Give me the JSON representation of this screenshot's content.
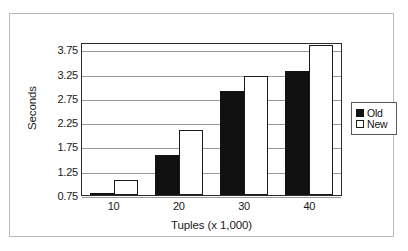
{
  "chart_data": {
    "type": "bar",
    "title": "",
    "xlabel": "Tuples (x 1,000)",
    "ylabel": "Seconds",
    "categories": [
      "10",
      "20",
      "30",
      "40"
    ],
    "yticks": [
      "3.75",
      "3.25",
      "2.75",
      "2.25",
      "1.75",
      "1.25",
      "0.75"
    ],
    "ylim": [
      0.75,
      3.9
    ],
    "grid": true,
    "legend_position": "right",
    "series": [
      {
        "name": "Old",
        "color": "#111111",
        "values": [
          0.8,
          1.57,
          2.9,
          3.31
        ]
      },
      {
        "name": "New",
        "color": "#ffffff",
        "values": [
          1.05,
          2.08,
          3.2,
          3.84
        ]
      }
    ]
  },
  "legend": {
    "items": [
      {
        "label": "Old",
        "swatch": "filled-black-square"
      },
      {
        "label": "New",
        "swatch": "empty-white-square"
      }
    ]
  }
}
